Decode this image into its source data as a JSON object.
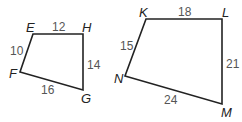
{
  "figures": [
    {
      "name": "EFGH",
      "vertices": {
        "E": "E",
        "H": "H",
        "G": "G",
        "F": "F"
      },
      "sides": {
        "EH": "12",
        "HG": "14",
        "GF": "16",
        "FE": "10"
      }
    },
    {
      "name": "KLMN",
      "vertices": {
        "K": "K",
        "L": "L",
        "M": "M",
        "N": "N"
      },
      "sides": {
        "KL": "18",
        "LM": "21",
        "MN": "24",
        "NK": "15"
      }
    }
  ]
}
